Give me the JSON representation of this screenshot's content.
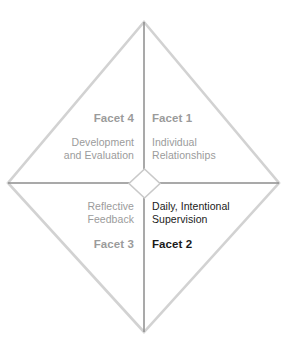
{
  "diagram": {
    "type": "four-quadrant-diamond",
    "background_color": "#ffffff",
    "outline_color": "#d2d2d2",
    "axis_color": "#8c8c8c",
    "muted_text_color": "#9b9b9b",
    "strong_text_color": "#1a1a1a",
    "center_marker": "small-diamond",
    "quadrants": [
      {
        "id": "facet-1",
        "position": "top-right",
        "facet_label": "Facet 1",
        "description_lines": [
          "Individual",
          "Relationships"
        ],
        "emphasis": "muted"
      },
      {
        "id": "facet-2",
        "position": "bottom-right",
        "facet_label": "Facet 2",
        "description_lines": [
          "Daily, Intentional",
          "Supervision"
        ],
        "emphasis": "strong"
      },
      {
        "id": "facet-3",
        "position": "bottom-left",
        "facet_label": "Facet 3",
        "description_lines": [
          "Reflective",
          "Feedback"
        ],
        "emphasis": "muted"
      },
      {
        "id": "facet-4",
        "position": "top-left",
        "facet_label": "Facet 4",
        "description_lines": [
          "Development",
          "and Evaluation"
        ],
        "emphasis": "muted"
      }
    ]
  }
}
